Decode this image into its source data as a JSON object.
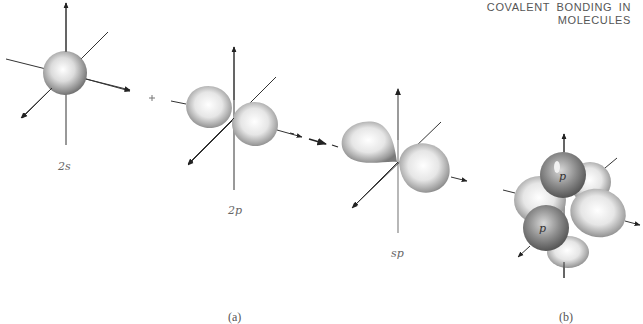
{
  "header": {
    "line1": "COVALENT BONDING IN",
    "line2": "MOLECULES"
  },
  "figure": {
    "panel_a": {
      "caption": "(a)",
      "orbitals": [
        {
          "label": "2s",
          "shape": "sphere"
        },
        {
          "label": "2p",
          "shape": "two-lobed dumbbell"
        },
        {
          "label": "sp",
          "shape": "asymmetric hybrid lobes"
        }
      ],
      "operators": [
        "+",
        "arrow"
      ]
    },
    "panel_b": {
      "caption": "(b)",
      "lobe_labels": [
        "p",
        "p"
      ]
    }
  },
  "colors": {
    "axis": "#222222",
    "orbital_light": "#f4f4f4",
    "orbital_dark": "#7a7a7a",
    "text": "#555555"
  }
}
